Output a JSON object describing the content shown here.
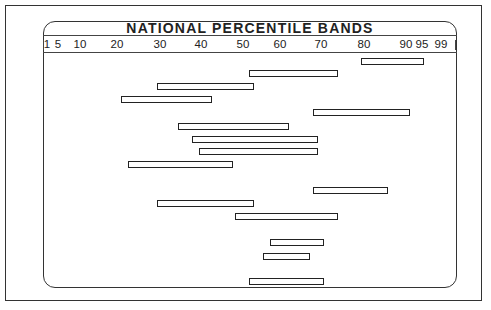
{
  "chart_data": {
    "type": "bar",
    "subtype": "horizontal-range (floating percentile bands)",
    "title": "NATIONAL PERCENTILE BANDS",
    "xlabel": "",
    "ylabel": "",
    "x_scale": "percentile (normal-curve spacing)",
    "xlim": [
      1,
      99
    ],
    "grid": false,
    "legend": null,
    "x_ticks": [
      {
        "label": "1",
        "x": 47
      },
      {
        "label": "5",
        "x": 58
      },
      {
        "label": "10",
        "x": 80
      },
      {
        "label": "20",
        "x": 117
      },
      {
        "label": "30",
        "x": 160
      },
      {
        "label": "40",
        "x": 201
      },
      {
        "label": "50",
        "x": 243
      },
      {
        "label": "60",
        "x": 280
      },
      {
        "label": "70",
        "x": 321
      },
      {
        "label": "80",
        "x": 364
      },
      {
        "label": "90",
        "x": 406
      },
      {
        "label": "95",
        "x": 422
      },
      {
        "label": "99",
        "x": 441
      }
    ],
    "bands": [
      {
        "row": 1,
        "low": 79,
        "high": 96,
        "x1": 361,
        "x2": 425,
        "y": 58
      },
      {
        "row": 2,
        "low": 51,
        "high": 74,
        "x1": 249,
        "x2": 339,
        "y": 70
      },
      {
        "row": 3,
        "low": 29,
        "high": 53,
        "x1": 157,
        "x2": 255,
        "y": 83
      },
      {
        "row": 4,
        "low": 21,
        "high": 42,
        "x1": 121,
        "x2": 213,
        "y": 96
      },
      {
        "row": 5,
        "low": 68,
        "high": 91,
        "x1": 313,
        "x2": 411,
        "y": 109
      },
      {
        "row": 6,
        "low": 34,
        "high": 62,
        "x1": 178,
        "x2": 290,
        "y": 123
      },
      {
        "row": 7,
        "low": 38,
        "high": 69,
        "x1": 192,
        "x2": 319,
        "y": 136
      },
      {
        "row": 8,
        "low": 40,
        "high": 69,
        "x1": 199,
        "x2": 319,
        "y": 148
      },
      {
        "row": 9,
        "low": 23,
        "high": 48,
        "x1": 128,
        "x2": 234,
        "y": 161
      },
      {
        "row": 10,
        "low": 68,
        "high": 86,
        "x1": 313,
        "x2": 389,
        "y": 187
      },
      {
        "row": 11,
        "low": 29,
        "high": 53,
        "x1": 157,
        "x2": 255,
        "y": 200
      },
      {
        "row": 12,
        "low": 48,
        "high": 74,
        "x1": 235,
        "x2": 339,
        "y": 213
      },
      {
        "row": 13,
        "low": 57,
        "high": 71,
        "x1": 270,
        "x2": 325,
        "y": 239
      },
      {
        "row": 14,
        "low": 55,
        "high": 67,
        "x1": 263,
        "x2": 311,
        "y": 253
      },
      {
        "row": 15,
        "low": 51,
        "high": 71,
        "x1": 249,
        "x2": 325,
        "y": 278
      }
    ]
  },
  "colors": {
    "background": "#ffffff",
    "line": "#222222"
  }
}
